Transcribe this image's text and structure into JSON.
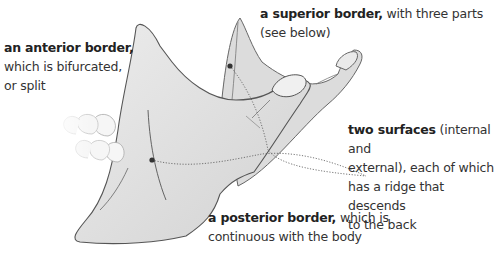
{
  "diagram": {
    "labels": {
      "anterior": {
        "bold": "an anterior border,",
        "rest_lines": [
          "which is bifurcated,",
          "or split"
        ]
      },
      "superior": {
        "bold": "a superior border,",
        "rest": " with three parts",
        "line2": "(see below)"
      },
      "surfaces": {
        "bold": "two surfaces",
        "rest": " (internal and",
        "lines": [
          "external), each of which",
          "has a ridge that descends",
          "to the back"
        ]
      },
      "posterior": {
        "bold": "a posterior border,",
        "rest": " which is",
        "line2": "continuous with the body"
      }
    },
    "colors": {
      "bone_fill": "#e3e3e3",
      "bone_shade": "#cfcfcf",
      "outline": "#555555",
      "dots": "#333333",
      "teeth": "#f4f4f4"
    }
  }
}
